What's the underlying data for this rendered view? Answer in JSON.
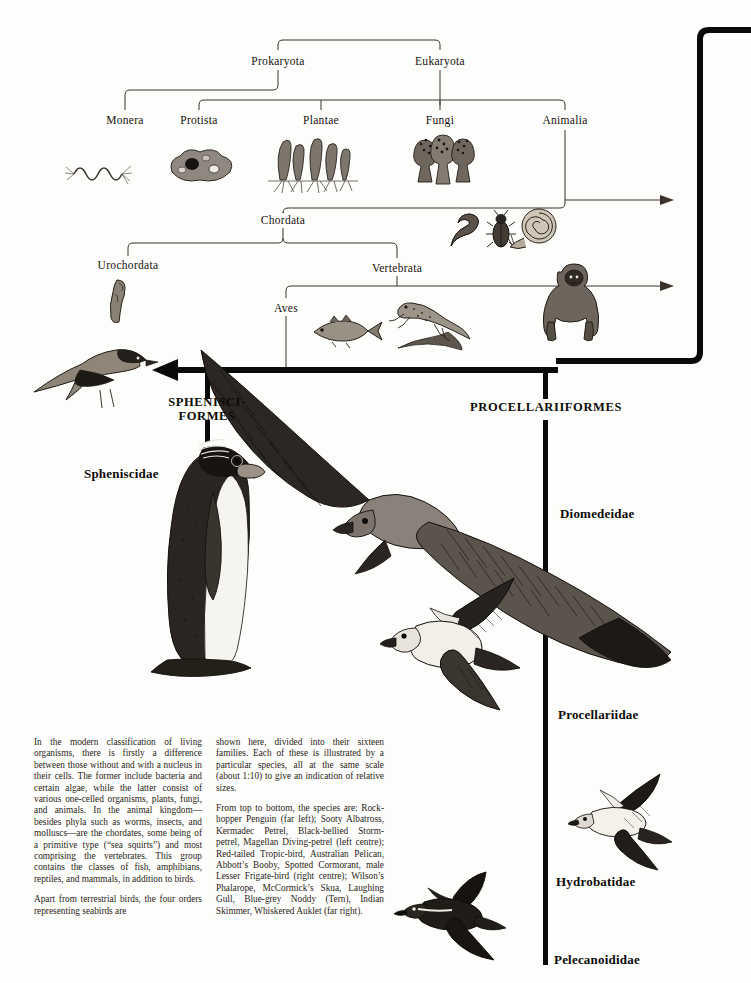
{
  "page": {
    "background_color": "#fdfdfb",
    "ink_color": "#0d0b09"
  },
  "taxonomy": {
    "nodes": [
      {
        "id": "prokaryota",
        "label": "Prokaryota",
        "x": 278,
        "y": 62
      },
      {
        "id": "eukaryota",
        "label": "Eukaryota",
        "x": 440,
        "y": 62
      },
      {
        "id": "monera",
        "label": "Monera",
        "x": 125,
        "y": 121
      },
      {
        "id": "protista",
        "label": "Protista",
        "x": 199,
        "y": 121
      },
      {
        "id": "plantae",
        "label": "Plantae",
        "x": 321,
        "y": 121
      },
      {
        "id": "fungi",
        "label": "Fungi",
        "x": 440,
        "y": 121
      },
      {
        "id": "animalia",
        "label": "Animalia",
        "x": 565,
        "y": 121
      },
      {
        "id": "chordata",
        "label": "Chordata",
        "x": 283,
        "y": 220
      },
      {
        "id": "urochordata",
        "label": "Urochordata",
        "x": 128,
        "y": 265
      },
      {
        "id": "vertebrata",
        "label": "Vertebrata",
        "x": 397,
        "y": 268
      },
      {
        "id": "aves",
        "label": "Aves",
        "x": 286,
        "y": 308
      }
    ]
  },
  "orders": [
    {
      "id": "sphenisciformes",
      "line1": "SPHENISCI-",
      "line2": "FORMES",
      "x": 207,
      "y": 401
    },
    {
      "id": "procellariiformes",
      "line1": "PROCELLARIIFORMES",
      "line2": "",
      "x": 546,
      "y": 401
    }
  ],
  "families": [
    {
      "id": "spheniscidae",
      "label": "Spheniscidae",
      "x": 84,
      "y": 466
    },
    {
      "id": "diomedeidae",
      "label": "Diomedeidae",
      "x": 560,
      "y": 506
    },
    {
      "id": "procellariidae",
      "label": "Procellariidae",
      "x": 558,
      "y": 707
    },
    {
      "id": "hydrobatidae",
      "label": "Hydrobatidae",
      "x": 556,
      "y": 874
    },
    {
      "id": "pelecanoididae",
      "label": "Pelecanoididae",
      "x": 554,
      "y": 952
    }
  ],
  "illustrations": [
    {
      "id": "bacteria",
      "name": "bacterium-illustration",
      "x": 72,
      "y": 150
    },
    {
      "id": "amoeba",
      "name": "protist-illustration",
      "x": 172,
      "y": 148
    },
    {
      "id": "algae",
      "name": "plant-algae-illustration",
      "x": 272,
      "y": 133
    },
    {
      "id": "fungi",
      "name": "fungi-illustration",
      "x": 410,
      "y": 130
    },
    {
      "id": "worm",
      "name": "worm-illustration",
      "x": 443,
      "y": 212
    },
    {
      "id": "beetle",
      "name": "beetle-illustration",
      "x": 490,
      "y": 212
    },
    {
      "id": "snail",
      "name": "snail-illustration",
      "x": 512,
      "y": 210
    },
    {
      "id": "tunicate",
      "name": "tunicate-illustration",
      "x": 107,
      "y": 280
    },
    {
      "id": "fish",
      "name": "fish-illustration",
      "x": 314,
      "y": 318
    },
    {
      "id": "lizard",
      "name": "lizard-illustration",
      "x": 392,
      "y": 300
    },
    {
      "id": "gorilla",
      "name": "gorilla-illustration",
      "x": 546,
      "y": 268
    },
    {
      "id": "songbird",
      "name": "terrestrial-bird-illustration",
      "x": 24,
      "y": 348
    },
    {
      "id": "penguin",
      "name": "rockhopper-penguin-illustration",
      "x": 150,
      "y": 435
    },
    {
      "id": "albatross",
      "name": "sooty-albatross-illustration",
      "x": 190,
      "y": 348
    },
    {
      "id": "petrel",
      "name": "kermadec-petrel-illustration",
      "x": 366,
      "y": 580
    },
    {
      "id": "stormpetrel",
      "name": "black-bellied-storm-petrel-illustration",
      "x": 575,
      "y": 768
    },
    {
      "id": "divingpetrel",
      "name": "magellan-diving-petrel-illustration",
      "x": 400,
      "y": 872
    }
  ],
  "body_text": {
    "column_left": [
      "In the modern classification of living organisms, there is firstly a difference between those without and with a nucleus in their cells. The former include bacteria and certain algae, while the latter consist of various one-celled organisms, plants, fungi, and animals. In the animal kingdom—besides phyla such as worms, insects, and molluscs—are the chordates, some being of a primitive type (“sea squirts”) and most comprising the vertebrates. This group contains the classes of fish, amphibians, reptiles, and mammals, in addition to birds.",
      "Apart from terrestrial birds, the four orders representing seabirds are"
    ],
    "column_right": [
      "shown here, divided into their sixteen families. Each of these is illustrated by a particular species, all at the same scale (about 1:10) to give an indication of relative sizes.",
      "From top to bottom, the species are: Rock-hopper Penguin (far left); Sooty Albatross, Kermadec Petrel, Black-bellied Storm-petrel, Magellan Diving-petrel (left centre); Red-tailed Tropic-bird, Australian Pelican, Abbott’s Booby, Spotted Cormorant, male Lesser Frigate-bird (right centre); Wilson’s Phalarope, McCormick’s Skua, Laughing Gull, Blue-grey Noddy (Tern), Indian Skimmer, Whiskered Auklet (far right)."
    ]
  }
}
